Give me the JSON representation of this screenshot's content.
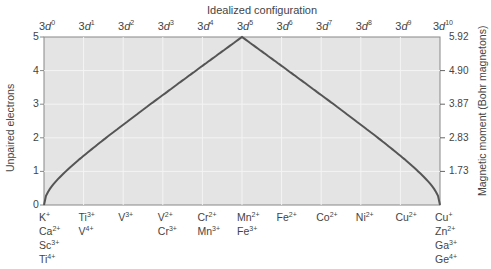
{
  "chart_data": {
    "type": "line",
    "title": "Idealized configuration",
    "xlabel": "",
    "ylabel": "Unpaired electrons",
    "y2label": "Magnetic moment (Bohr magnetons)",
    "x_top_ticks": [
      "3d0",
      "3d1",
      "3d2",
      "3d3",
      "3d4",
      "3d5",
      "3d6",
      "3d7",
      "3d8",
      "3d9",
      "3d10"
    ],
    "x_top_ticks_parts": [
      {
        "base": "3d",
        "exp": "0"
      },
      {
        "base": "3d",
        "exp": "1"
      },
      {
        "base": "3d",
        "exp": "2"
      },
      {
        "base": "3d",
        "exp": "3"
      },
      {
        "base": "3d",
        "exp": "4"
      },
      {
        "base": "3d",
        "exp": "5"
      },
      {
        "base": "3d",
        "exp": "6"
      },
      {
        "base": "3d",
        "exp": "7"
      },
      {
        "base": "3d",
        "exp": "8"
      },
      {
        "base": "3d",
        "exp": "9"
      },
      {
        "base": "3d",
        "exp": "10"
      }
    ],
    "x_bottom_ions": [
      [
        {
          "el": "K",
          "ch": "+"
        },
        {
          "el": "Ca",
          "ch": "2+"
        },
        {
          "el": "Sc",
          "ch": "3+"
        },
        {
          "el": "Ti",
          "ch": "4+"
        }
      ],
      [
        {
          "el": "Ti",
          "ch": "3+"
        },
        {
          "el": "V",
          "ch": "4+"
        }
      ],
      [
        {
          "el": "V",
          "ch": "3+"
        }
      ],
      [
        {
          "el": "V",
          "ch": "2+"
        },
        {
          "el": "Cr",
          "ch": "3+"
        }
      ],
      [
        {
          "el": "Cr",
          "ch": "2+"
        },
        {
          "el": "Mn",
          "ch": "3+"
        }
      ],
      [
        {
          "el": "Mn",
          "ch": "2+"
        },
        {
          "el": "Fe",
          "ch": "3+"
        }
      ],
      [
        {
          "el": "Fe",
          "ch": "2+"
        }
      ],
      [
        {
          "el": "Co",
          "ch": "2+"
        }
      ],
      [
        {
          "el": "Ni",
          "ch": "2+"
        }
      ],
      [
        {
          "el": "Cu",
          "ch": "2+"
        }
      ],
      [
        {
          "el": "Cu",
          "ch": "+"
        },
        {
          "el": "Zn",
          "ch": "2+"
        },
        {
          "el": "Ga",
          "ch": "3+"
        },
        {
          "el": "Ge",
          "ch": "4+"
        }
      ]
    ],
    "y_ticks": [
      "0",
      "1",
      "2",
      "3",
      "4",
      "5"
    ],
    "y2_ticks": [
      "1.73",
      "2.83",
      "3.87",
      "4.90",
      "5.92"
    ],
    "ylim": [
      0,
      5
    ],
    "x": [
      0,
      1,
      2,
      3,
      4,
      5,
      6,
      7,
      8,
      9,
      10
    ],
    "series": [
      {
        "name": "Magnetic moment (spin-only)",
        "unpaired_electrons": [
          0,
          1,
          2,
          3,
          4,
          5,
          4,
          3,
          2,
          1,
          0
        ],
        "magnetic_moment_BM": [
          0,
          1.73,
          2.83,
          3.87,
          4.9,
          5.92,
          4.9,
          3.87,
          2.83,
          1.73,
          0
        ],
        "values": [
          0,
          1.2,
          2.2,
          3.15,
          4.1,
          5,
          4.1,
          3.15,
          2.2,
          1.2,
          0
        ]
      }
    ],
    "grid": true,
    "legend": "none"
  },
  "colors": {
    "plot_bg": "#e4e4e4",
    "grid": "#f4f4f4",
    "line": "#555555",
    "frame": "#888888",
    "text": "#444444"
  }
}
